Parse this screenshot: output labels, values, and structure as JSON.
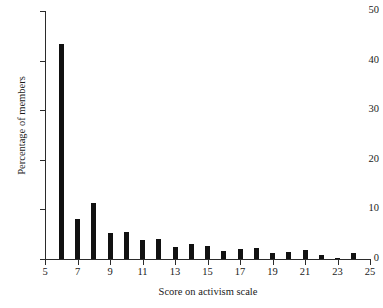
{
  "chart_data": {
    "type": "bar",
    "title": "",
    "xlabel": "Score on activism scale",
    "ylabel": "Percentage of members",
    "xlim": [
      5,
      25
    ],
    "ylim": [
      0,
      50
    ],
    "grid": false,
    "legend": null,
    "x_ticks": [
      5,
      7,
      9,
      11,
      13,
      15,
      17,
      19,
      21,
      23,
      25
    ],
    "y_ticks": [
      0,
      10,
      20,
      30,
      40,
      50
    ],
    "bar_color": "#111111",
    "axis_color": "#2b2b2b",
    "categories": [
      6,
      7,
      8,
      9,
      10,
      11,
      12,
      13,
      14,
      15,
      16,
      17,
      18,
      19,
      20,
      21,
      22,
      23,
      24
    ],
    "values": [
      43.3,
      8.1,
      11.3,
      5.3,
      5.4,
      3.9,
      4.1,
      2.4,
      3.1,
      2.6,
      1.6,
      2.0,
      2.3,
      1.2,
      1.5,
      1.8,
      0.9,
      0.3,
      1.2
    ]
  },
  "axes": {
    "x_title": "Score on activism scale",
    "y_title": "Percentage of members"
  },
  "header": {
    "title_fragment": ""
  }
}
